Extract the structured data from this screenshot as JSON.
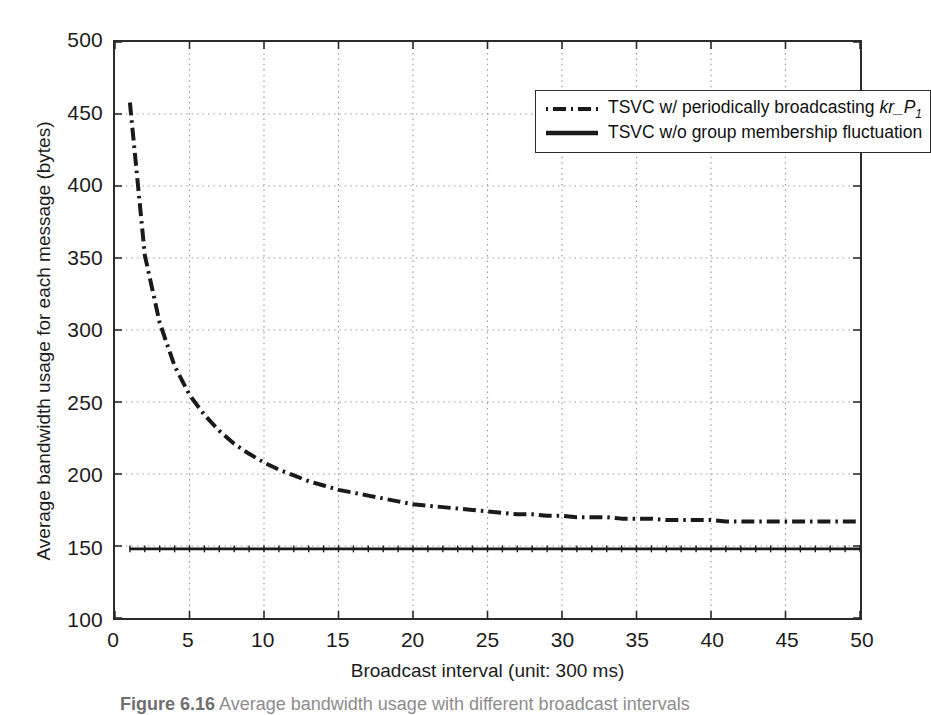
{
  "chart_data": {
    "type": "line",
    "title": "",
    "xlabel": "Broadcast interval (unit: 300 ms)",
    "ylabel": "Average bandwidth usage for each message (bytes)",
    "xlim": [
      0,
      50
    ],
    "ylim": [
      100,
      500
    ],
    "xticks": [
      0,
      5,
      10,
      15,
      20,
      25,
      30,
      35,
      40,
      45,
      50
    ],
    "yticks": [
      100,
      150,
      200,
      250,
      300,
      350,
      400,
      450,
      500
    ],
    "grid": true,
    "grid_style": "dotted",
    "legend_position": "top-right",
    "x": [
      1,
      2,
      3,
      4,
      5,
      6,
      7,
      8,
      9,
      10,
      11,
      12,
      13,
      14,
      15,
      16,
      17,
      18,
      19,
      20,
      21,
      22,
      23,
      24,
      25,
      26,
      27,
      28,
      29,
      30,
      31,
      32,
      33,
      34,
      35,
      36,
      37,
      38,
      39,
      40,
      41,
      42,
      43,
      44,
      45,
      46,
      47,
      48,
      49,
      50
    ],
    "series": [
      {
        "name": "TSVC w/ periodically broadcasting kr_P1",
        "linestyle": "dash-dot",
        "color": "#1a1a1a",
        "width": 4,
        "values": [
          458,
          352,
          305,
          275,
          255,
          241,
          230,
          221,
          214,
          208,
          203,
          199,
          195,
          192,
          189,
          187,
          185,
          183,
          181,
          179,
          178,
          177,
          176,
          175,
          174,
          173,
          172,
          172,
          171,
          171,
          170,
          170,
          170,
          169,
          169,
          169,
          168,
          168,
          168,
          168,
          167,
          167,
          167,
          167,
          167,
          167,
          167,
          167,
          167,
          167
        ]
      },
      {
        "name": "TSVC w/o group membership fluctuation",
        "linestyle": "solid",
        "color": "#1a1a1a",
        "width": 3,
        "values": [
          148,
          148,
          148,
          148,
          148,
          148,
          148,
          148,
          148,
          148,
          148,
          148,
          148,
          148,
          148,
          148,
          148,
          148,
          148,
          148,
          148,
          148,
          148,
          148,
          148,
          148,
          148,
          148,
          148,
          148,
          148,
          148,
          148,
          148,
          148,
          148,
          148,
          148,
          148,
          148,
          148,
          148,
          148,
          148,
          148,
          148,
          148,
          148,
          148,
          148
        ]
      }
    ]
  },
  "legend": {
    "entries": [
      {
        "sample": "dash-dot-line-sample",
        "text_before": "TSVC w/ periodically broadcasting ",
        "symbol": "kr_P",
        "subscript": "1"
      },
      {
        "sample": "solid-line-sample",
        "text_before": "TSVC w/o group membership fluctuation",
        "symbol": "",
        "subscript": ""
      }
    ]
  },
  "axes": {
    "x_title": "Broadcast interval (unit: 300 ms)",
    "y_title": "Average bandwidth usage for each message (bytes)",
    "x_tick_labels": [
      "0",
      "5",
      "10",
      "15",
      "20",
      "25",
      "30",
      "35",
      "40",
      "45",
      "50"
    ],
    "y_tick_labels": [
      "100",
      "150",
      "200",
      "250",
      "300",
      "350",
      "400",
      "450",
      "500"
    ]
  },
  "caption": {
    "number": "Figure 6.16",
    "text": "Average bandwidth usage with different broadcast intervals"
  },
  "colors": {
    "axis": "#2b2b2b",
    "grid": "#9a9a9a",
    "series": "#1a1a1a",
    "background": "#ffffff"
  }
}
